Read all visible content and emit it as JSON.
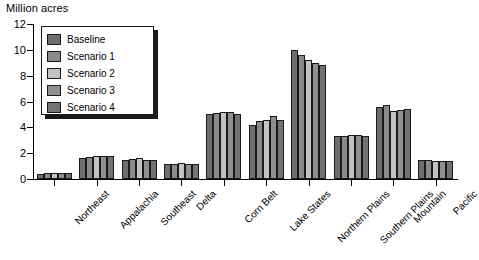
{
  "chart_data": {
    "type": "bar",
    "title": "",
    "ylabel": "Million acres",
    "xlabel": "",
    "ylim": [
      0,
      12
    ],
    "yticks": [
      0,
      2,
      4,
      6,
      8,
      10,
      12
    ],
    "grid": false,
    "legend_position": "upper-left-inset",
    "categories": [
      "Northeast",
      "Appalachia",
      "Southeast",
      "Delta",
      "Corn Belt",
      "Lake States",
      "Northern Plains",
      "Southern Plains",
      "Mountain",
      "Pacific"
    ],
    "series": [
      {
        "name": "Baseline",
        "color": "#6e6e6e",
        "values": [
          0.35,
          1.6,
          1.5,
          1.15,
          5.0,
          4.2,
          10.0,
          3.3,
          5.6,
          1.45
        ]
      },
      {
        "name": "Scenario 1",
        "color": "#8a8a8a",
        "values": [
          0.5,
          1.7,
          1.55,
          1.2,
          5.1,
          4.5,
          9.6,
          3.35,
          5.7,
          1.5
        ]
      },
      {
        "name": "Scenario 2",
        "color": "#c2c2c2",
        "values": [
          0.5,
          1.8,
          1.6,
          1.25,
          5.15,
          4.6,
          9.2,
          3.4,
          5.3,
          1.4
        ]
      },
      {
        "name": "Scenario 3",
        "color": "#8f8f8f",
        "values": [
          0.5,
          1.75,
          1.45,
          1.2,
          5.15,
          4.85,
          9.0,
          3.4,
          5.35,
          1.4
        ]
      },
      {
        "name": "Scenario 4",
        "color": "#737373",
        "values": [
          0.5,
          1.75,
          1.45,
          1.15,
          5.05,
          4.6,
          8.85,
          3.35,
          5.4,
          1.4
        ]
      }
    ]
  },
  "legend": {
    "items": [
      {
        "label": "Baseline"
      },
      {
        "label": "Scenario 1"
      },
      {
        "label": "Scenario 2"
      },
      {
        "label": "Scenario 3"
      },
      {
        "label": "Scenario 4"
      }
    ]
  }
}
